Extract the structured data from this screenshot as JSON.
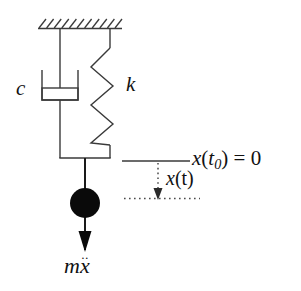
{
  "figure": {
    "background_color": "#ffffff",
    "line_color": "#3a3a3a",
    "mass_color": "#000000",
    "text_color": "#111111",
    "width": 301,
    "height": 291
  },
  "labels": {
    "damper_coefficient": "c",
    "spring_constant": "k",
    "initial_position_variable": "x",
    "initial_position_time": "t",
    "initial_position_subscript": "0",
    "initial_position_equals": " = 0",
    "displacement_variable": "x",
    "displacement_argument": "(t)",
    "inertia_mass": "m",
    "inertia_accel": "x",
    "inertia_accel_dots": "̈"
  },
  "elements": {
    "ceiling": {
      "name": "fixed-support-ceiling",
      "hatch_count": 11,
      "x_start": 38,
      "x_end": 122,
      "y": 28
    },
    "damper": {
      "name": "dashpot-damper",
      "x_center": 60,
      "top_y": 28,
      "cylinder_top_y": 70,
      "cylinder_bottom_y": 100,
      "bottom_y": 158
    },
    "spring": {
      "name": "coil-spring",
      "x_center": 110,
      "top_y": 28,
      "zigzag_start_y": 48,
      "zigzag_end_y": 145,
      "bottom_y": 158,
      "coils": 5
    },
    "mass": {
      "name": "point-mass",
      "cx": 85,
      "cy": 203,
      "r": 15
    },
    "force_arrow": {
      "name": "inertia-force-arrow",
      "x": 85,
      "y_start": 218,
      "y_end": 252,
      "direction": "down"
    },
    "reference_line": {
      "name": "initial-position-reference-line",
      "x_start": 122,
      "x_end": 190,
      "y": 161,
      "style": "solid"
    },
    "displacement_arrow": {
      "name": "displacement-arrow",
      "x": 158,
      "y_start": 163,
      "y_end": 199,
      "style": "dotted",
      "direction": "down"
    },
    "displacement_line": {
      "name": "current-position-dotted-line",
      "x_start": 124,
      "x_end": 200,
      "y": 199,
      "style": "dotted"
    }
  }
}
